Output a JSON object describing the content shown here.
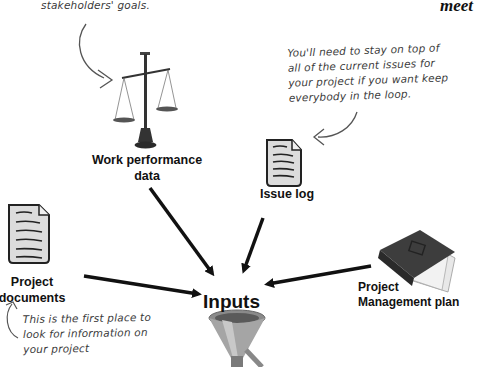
{
  "header": {
    "partial_title": "meet"
  },
  "annotations": {
    "top_note": "stakeholders' goals.",
    "issue_note": [
      "You'll need to stay on top of",
      "all of the current issues for",
      "your project if you want keep",
      "everybody in the loop."
    ],
    "documents_note": [
      "This is the first place to",
      "look for information on",
      "your project"
    ]
  },
  "nodes": {
    "work_performance": {
      "label_line1": "Work performance",
      "label_line2": "data",
      "icon": "scale-icon"
    },
    "issue_log": {
      "label": "Issue log",
      "icon": "document-icon"
    },
    "project_documents": {
      "label_line1": "Project",
      "label_line2": "documents",
      "icon": "document-icon"
    },
    "management_plan": {
      "label_line1": "Project",
      "label_line2": "Management plan",
      "icon": "binder-icon"
    },
    "inputs": {
      "label": "Inputs",
      "icon": "funnel-icon"
    }
  },
  "colors": {
    "arrow": "#111111",
    "handwriting": "#3a3a3a",
    "paper": "#e4e4e4",
    "binder": "#3d3d3d"
  }
}
